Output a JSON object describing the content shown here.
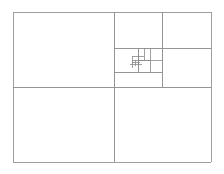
{
  "figure": {
    "name": "fibonacci-golden-rectangle-subdivision",
    "kind": "geometric-diagram",
    "background_color": "#ffffff",
    "stroke_color": "#8a8a8a",
    "stroke_color_outer": "#9a9a9a",
    "stroke_width": 1,
    "canvas": {
      "width": 224,
      "height": 174
    },
    "outer_rect": {
      "x": 13,
      "y": 12,
      "width": 198,
      "height": 150
    },
    "labels": [],
    "annotations": [],
    "segments": [
      {
        "name": "outer-top",
        "x1": 13,
        "y1": 12,
        "x2": 211,
        "y2": 12,
        "weight": "outer"
      },
      {
        "name": "outer-right",
        "x1": 211,
        "y1": 12,
        "x2": 211,
        "y2": 162,
        "weight": "outer"
      },
      {
        "name": "outer-bottom",
        "x1": 13,
        "y1": 162,
        "x2": 211,
        "y2": 162,
        "weight": "outer"
      },
      {
        "name": "outer-left",
        "x1": 13,
        "y1": 12,
        "x2": 13,
        "y2": 162,
        "weight": "outer"
      },
      {
        "name": "primary-vertical-split",
        "x1": 114,
        "y1": 12,
        "x2": 114,
        "y2": 162,
        "weight": "main"
      },
      {
        "name": "primary-horizontal-split",
        "x1": 13,
        "y1": 87,
        "x2": 211,
        "y2": 87,
        "weight": "main"
      },
      {
        "name": "right-upper-vertical-split",
        "x1": 162,
        "y1": 12,
        "x2": 162,
        "y2": 87,
        "weight": "main"
      },
      {
        "name": "right-upper-horizontal-split",
        "x1": 162,
        "y1": 48,
        "x2": 211,
        "y2": 48,
        "weight": "main"
      },
      {
        "name": "mid-horizontal-split",
        "x1": 114,
        "y1": 48,
        "x2": 162,
        "y2": 48,
        "weight": "main"
      },
      {
        "name": "mid-lower-horizontal",
        "x1": 114,
        "y1": 72,
        "x2": 162,
        "y2": 72,
        "weight": "main"
      },
      {
        "name": "mid-vertical-split",
        "x1": 138,
        "y1": 48,
        "x2": 138,
        "y2": 72,
        "weight": "main"
      },
      {
        "name": "inner-vertical-split",
        "x1": 150,
        "y1": 48,
        "x2": 150,
        "y2": 72,
        "weight": "fine"
      },
      {
        "name": "inner-horizontal-split",
        "x1": 138,
        "y1": 60,
        "x2": 162,
        "y2": 60,
        "weight": "fine"
      },
      {
        "name": "inner2-vertical-split",
        "x1": 144,
        "y1": 48,
        "x2": 144,
        "y2": 60,
        "weight": "fine"
      },
      {
        "name": "inner2-horizontal-split",
        "x1": 132,
        "y1": 60,
        "x2": 150,
        "y2": 60,
        "weight": "fine"
      },
      {
        "name": "core-vertical-a",
        "x1": 132,
        "y1": 56,
        "x2": 132,
        "y2": 68,
        "weight": "fine"
      },
      {
        "name": "core-horizontal-a",
        "x1": 132,
        "y1": 56,
        "x2": 144,
        "y2": 56,
        "weight": "fine"
      },
      {
        "name": "core-vertical-b",
        "x1": 138,
        "y1": 56,
        "x2": 138,
        "y2": 66,
        "weight": "fine"
      },
      {
        "name": "core-horizontal-b",
        "x1": 130,
        "y1": 64,
        "x2": 142,
        "y2": 64,
        "weight": "fine"
      },
      {
        "name": "core-vertical-c",
        "x1": 135,
        "y1": 60,
        "x2": 135,
        "y2": 66,
        "weight": "fine"
      },
      {
        "name": "core-horizontal-c",
        "x1": 132,
        "y1": 62,
        "x2": 140,
        "y2": 62,
        "weight": "fine"
      }
    ]
  }
}
